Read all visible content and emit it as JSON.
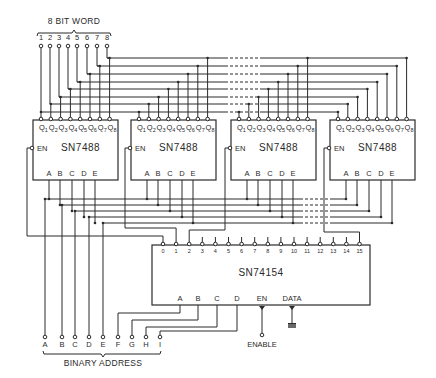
{
  "diagram": {
    "word_label": "8 BIT WORD",
    "word_pins": [
      "1",
      "2",
      "3",
      "4",
      "5",
      "6",
      "7",
      "8"
    ],
    "comparators": [
      {
        "part": "SN7488",
        "outputs": [
          "Q1",
          "Q2",
          "Q3",
          "Q4",
          "Q5",
          "Q6",
          "Q7",
          "Q8"
        ],
        "enable": "EN",
        "inputs": [
          "A",
          "B",
          "C",
          "D",
          "E"
        ]
      },
      {
        "part": "SN7488",
        "outputs": [
          "Q1",
          "Q2",
          "Q3",
          "Q4",
          "Q5",
          "Q6",
          "Q7",
          "Q8"
        ],
        "enable": "EN",
        "inputs": [
          "A",
          "B",
          "C",
          "D",
          "E"
        ]
      },
      {
        "part": "SN7488",
        "outputs": [
          "Q1",
          "Q2",
          "Q3",
          "Q4",
          "Q5",
          "Q6",
          "Q7",
          "Q8"
        ],
        "enable": "EN",
        "inputs": [
          "A",
          "B",
          "C",
          "D",
          "E"
        ]
      },
      {
        "part": "SN7488",
        "outputs": [
          "Q1",
          "Q2",
          "Q3",
          "Q4",
          "Q5",
          "Q6",
          "Q7",
          "Q8"
        ],
        "enable": "EN",
        "inputs": [
          "A",
          "B",
          "C",
          "D",
          "E"
        ]
      }
    ],
    "decoder": {
      "part": "SN74154",
      "outputs": [
        "0",
        "1",
        "2",
        "3",
        "4",
        "5",
        "6",
        "7",
        "8",
        "9",
        "10",
        "11",
        "12",
        "13",
        "14",
        "15"
      ],
      "inputs": [
        "A",
        "B",
        "C",
        "D"
      ],
      "enable": "EN",
      "data": "DATA"
    },
    "address_pins": [
      "A",
      "B",
      "C",
      "D",
      "E",
      "F",
      "G",
      "H",
      "I"
    ],
    "address_label": "BINARY ADDRESS",
    "enable_label": "ENABLE"
  }
}
